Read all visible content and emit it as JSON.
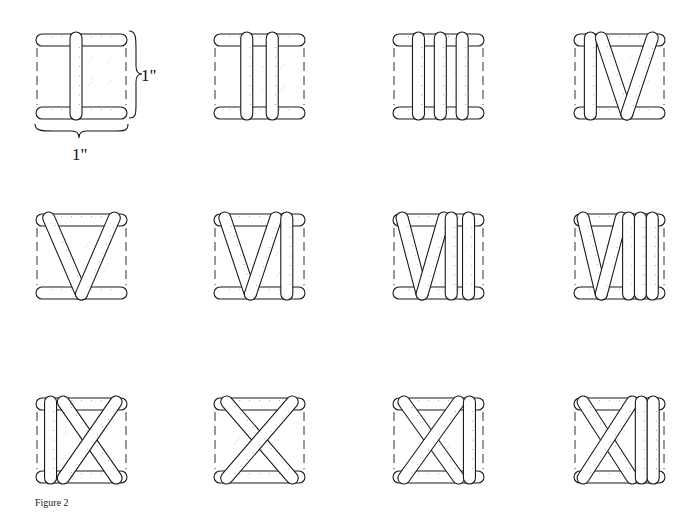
{
  "figure": {
    "caption": "Figure 2",
    "ink_color": "#1a1a1a",
    "dim_label_height": "1\"",
    "dim_label_width": "1\""
  },
  "tiles": [
    {
      "numeral": "I",
      "row": 0,
      "col": 0,
      "strokes": [
        [
          "v",
          0.44
        ]
      ]
    },
    {
      "numeral": "II",
      "row": 0,
      "col": 1,
      "strokes": [
        [
          "v",
          0.36
        ],
        [
          "v",
          0.64
        ]
      ]
    },
    {
      "numeral": "III",
      "row": 0,
      "col": 2,
      "strokes": [
        [
          "v",
          0.28
        ],
        [
          "v",
          0.52
        ],
        [
          "v",
          0.76
        ]
      ]
    },
    {
      "numeral": "IV",
      "row": 0,
      "col": 3,
      "strokes": [
        [
          "v",
          0.18
        ],
        [
          "d",
          0.3,
          0.58
        ],
        [
          "d",
          0.86,
          0.58
        ]
      ]
    },
    {
      "numeral": "V",
      "row": 1,
      "col": 0,
      "strokes": [
        [
          "d",
          0.14,
          0.5
        ],
        [
          "d",
          0.86,
          0.5
        ]
      ]
    },
    {
      "numeral": "VI",
      "row": 1,
      "col": 1,
      "strokes": [
        [
          "d",
          0.12,
          0.4
        ],
        [
          "d",
          0.68,
          0.4
        ],
        [
          "v",
          0.8
        ]
      ]
    },
    {
      "numeral": "VII",
      "row": 1,
      "col": 2,
      "strokes": [
        [
          "d",
          0.1,
          0.32
        ],
        [
          "d",
          0.56,
          0.32
        ],
        [
          "v",
          0.64
        ],
        [
          "v",
          0.83
        ]
      ]
    },
    {
      "numeral": "VIII",
      "row": 1,
      "col": 3,
      "strokes": [
        [
          "d",
          0.1,
          0.3
        ],
        [
          "d",
          0.52,
          0.3
        ],
        [
          "v",
          0.6
        ],
        [
          "v",
          0.73
        ],
        [
          "v",
          0.86
        ]
      ]
    },
    {
      "numeral": "IX",
      "row": 2,
      "col": 0,
      "strokes": [
        [
          "v",
          0.16
        ],
        [
          "x",
          0.3,
          0.88
        ]
      ]
    },
    {
      "numeral": "X",
      "row": 2,
      "col": 1,
      "strokes": [
        [
          "x",
          0.14,
          0.86
        ]
      ]
    },
    {
      "numeral": "XI",
      "row": 2,
      "col": 2,
      "strokes": [
        [
          "x",
          0.12,
          0.72
        ],
        [
          "v",
          0.84
        ]
      ]
    },
    {
      "numeral": "XII",
      "row": 2,
      "col": 3,
      "strokes": [
        [
          "x",
          0.1,
          0.64
        ],
        [
          "v",
          0.74
        ],
        [
          "v",
          0.87
        ]
      ]
    }
  ]
}
